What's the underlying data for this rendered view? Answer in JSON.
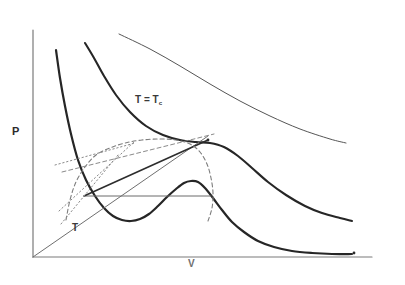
{
  "figure": {
    "kind": "p-v-diagram",
    "title_visible": false,
    "background_color": "#ffffff",
    "ink_color": "#2b2b2b",
    "light_ink_color": "#7d7d7d"
  },
  "axes": {
    "y_label": "P",
    "x_label": "V",
    "origin": {
      "x": 33,
      "y": 257
    },
    "y_axis_top": {
      "x": 33,
      "y": 30
    },
    "x_axis_right": {
      "x": 372,
      "y": 257
    },
    "axis_color": "#7a7a7a",
    "ticks_shown": false,
    "numbers_shown": false
  },
  "annotations": [
    {
      "name": "critical-isotherm-label",
      "text_main": "T = T",
      "text_sub": "c",
      "x": 135,
      "y": 94
    },
    {
      "name": "subcritical-isotherm-label",
      "text_main": "T",
      "text_sub": "",
      "x": 72,
      "y": 222
    },
    {
      "name": "pressure-axis-label",
      "text_main": "P",
      "text_sub": "",
      "x": 12,
      "y": 125
    },
    {
      "name": "volume-axis-label",
      "text_main": "V",
      "text_sub": "",
      "x": 188,
      "y": 258
    }
  ],
  "chart_data": {
    "type": "line",
    "title": "",
    "xlabel": "V",
    "ylabel": "P",
    "xlim": [
      0,
      405
    ],
    "ylim": [
      285,
      0
    ],
    "grid": false,
    "legend": "none",
    "axis_units": "arbitrary (unlabeled)",
    "series": [
      {
        "name": "supercritical-isotherm",
        "style": "solid-thin",
        "color": "#555555",
        "width": 1.0,
        "note": "uppermost light isotherm, T greater than Tc",
        "points": [
          [
            119,
            34
          ],
          [
            150,
            49
          ],
          [
            180,
            66
          ],
          [
            210,
            84
          ],
          [
            240,
            101
          ],
          [
            270,
            116
          ],
          [
            300,
            129
          ],
          [
            330,
            139
          ],
          [
            346,
            143
          ]
        ]
      },
      {
        "name": "critical-isotherm",
        "style": "solid-thick",
        "color": "#262626",
        "width": 2.1,
        "note": "isotherm at T = Tc with inflection at critical point",
        "points": [
          [
            85,
            43
          ],
          [
            94,
            58
          ],
          [
            104,
            76
          ],
          [
            116,
            95
          ],
          [
            130,
            112
          ],
          [
            146,
            126
          ],
          [
            163,
            135
          ],
          [
            180,
            140
          ],
          [
            196,
            142
          ],
          [
            210,
            143
          ],
          [
            224,
            147
          ],
          [
            238,
            156
          ],
          [
            252,
            168
          ],
          [
            268,
            182
          ],
          [
            286,
            195
          ],
          [
            305,
            206
          ],
          [
            322,
            213
          ],
          [
            340,
            218
          ],
          [
            352,
            221
          ]
        ]
      },
      {
        "name": "subcritical-isotherm",
        "style": "solid-thick",
        "color": "#262626",
        "width": 2.2,
        "note": "van der Waals loop below Tc: steep branch, minimum, local maximum, decay",
        "points": [
          [
            56,
            50
          ],
          [
            60,
            78
          ],
          [
            65,
            106
          ],
          [
            71,
            134
          ],
          [
            78,
            160
          ],
          [
            86,
            180
          ],
          [
            95,
            196
          ],
          [
            104,
            208
          ],
          [
            113,
            216
          ],
          [
            122,
            220
          ],
          [
            131,
            221
          ],
          [
            140,
            219
          ],
          [
            149,
            214
          ],
          [
            158,
            206
          ],
          [
            167,
            197
          ],
          [
            176,
            189
          ],
          [
            184,
            183
          ],
          [
            191,
            181
          ],
          [
            198,
            182
          ],
          [
            205,
            188
          ],
          [
            213,
            198
          ],
          [
            222,
            210
          ],
          [
            232,
            222
          ],
          [
            244,
            232
          ],
          [
            258,
            241
          ],
          [
            274,
            247
          ],
          [
            292,
            251
          ],
          [
            312,
            253
          ],
          [
            332,
            254
          ],
          [
            352,
            254
          ]
        ]
      },
      {
        "name": "maxwell-tie-line",
        "style": "solid-thin",
        "color": "#6b6b6b",
        "width": 1.0,
        "note": "horizontal equal-area construction line",
        "points": [
          [
            85,
            196
          ],
          [
            211,
            196
          ]
        ]
      },
      {
        "name": "origin-ray",
        "style": "solid-thin",
        "color": "#6f6f6f",
        "width": 1.0,
        "note": "straight line through the origin rising to the critical point",
        "points": [
          [
            33,
            257
          ],
          [
            208,
            136
          ]
        ]
      },
      {
        "name": "chord-line",
        "style": "solid-thick",
        "color": "#2d2d2d",
        "width": 1.6,
        "note": "thick straight chord from left branch up to the critical point",
        "points": [
          [
            84,
            196
          ],
          [
            208,
            140
          ]
        ]
      },
      {
        "name": "coexistence-dome",
        "style": "dashed",
        "color": "#7d7d7d",
        "width": 1.1,
        "note": "dashed binodal / spinodal arc peaking at the critical point",
        "points": [
          [
            66,
            220
          ],
          [
            70,
            200
          ],
          [
            76,
            182
          ],
          [
            85,
            167
          ],
          [
            96,
            155
          ],
          [
            110,
            148
          ],
          [
            125,
            143
          ],
          [
            142,
            140
          ],
          [
            160,
            139
          ],
          [
            176,
            140
          ],
          [
            190,
            144
          ],
          [
            200,
            152
          ],
          [
            207,
            164
          ],
          [
            211,
            178
          ],
          [
            213,
            193
          ],
          [
            212,
            208
          ],
          [
            208,
            221
          ]
        ]
      },
      {
        "name": "tangent-dashed",
        "style": "dashed",
        "color": "#8a8a8a",
        "width": 1.0,
        "note": "dashed straight tangent line of the fan construction",
        "points": [
          [
            62,
            172
          ],
          [
            214,
            134
          ]
        ]
      },
      {
        "name": "tangent-dotted-upper",
        "style": "dotted",
        "color": "#8a8a8a",
        "width": 1.0,
        "note": "dotted construction line, shallow slope",
        "points": [
          [
            55,
            165
          ],
          [
            135,
            143
          ]
        ]
      },
      {
        "name": "tangent-dotted-steep",
        "style": "dotted",
        "color": "#8a8a8a",
        "width": 1.0,
        "note": "dotted construction line rising steeply to the right",
        "points": [
          [
            59,
            211
          ],
          [
            134,
            142
          ]
        ]
      },
      {
        "name": "tangent-dotted-lower",
        "style": "dotted",
        "color": "#8a8a8a",
        "width": 1.0,
        "note": "dotted construction line from lower left",
        "points": [
          [
            61,
            224
          ],
          [
            118,
            155
          ]
        ]
      }
    ],
    "markers": [
      {
        "name": "critical-point",
        "x": 208,
        "y": 140,
        "label": ""
      },
      {
        "name": "end-tick-lower-isotherm",
        "x": 354,
        "y": 253,
        "label": ""
      }
    ]
  }
}
